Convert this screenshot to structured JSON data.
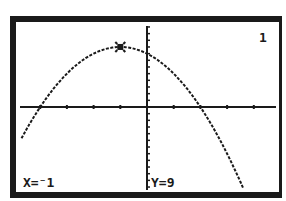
{
  "calculator": {
    "graph_number": "1",
    "trace": {
      "x_label": "X=⁻1",
      "y_label": "Y=9",
      "x": -1,
      "y": 9
    },
    "colors": {
      "ink": "#1a1a1a",
      "background": "#ffffff"
    }
  },
  "chart_data": {
    "type": "line",
    "title": "",
    "function": "y = -(x+1)^2 + 9",
    "x": [
      -4.7,
      -4,
      -3,
      -2,
      -1,
      0,
      1,
      2,
      3,
      3.9
    ],
    "series": [
      {
        "name": "Y1",
        "values": [
          -4.69,
          0,
          5,
          8,
          9,
          8,
          5,
          0,
          -7,
          -15.01
        ]
      }
    ],
    "xlim": [
      -4.7,
      4.7
    ],
    "ylim": [
      -13,
      13
    ],
    "xscale": 1,
    "yscale": 1,
    "grid": false,
    "trace_point": {
      "x": -1,
      "y": 9
    },
    "roots": [
      -4,
      2
    ],
    "y_intercept": 8
  }
}
